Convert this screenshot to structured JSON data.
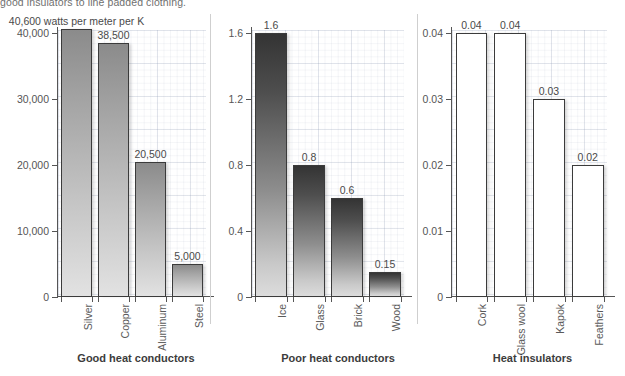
{
  "body_text": "good insulators to line padded clothing.",
  "chart_data": [
    {
      "type": "bar",
      "title": "Good heat conductors",
      "unit_annotation": "40,600 watts per meter per K",
      "categories": [
        "Silver",
        "Copper",
        "Aluminum",
        "Steel"
      ],
      "values": [
        40600,
        38500,
        20500,
        5000
      ],
      "value_labels": [
        "40,600 watts per meter per K",
        "38,500",
        "20,500",
        "5,000"
      ],
      "ticks": [
        0,
        10000,
        20000,
        30000,
        40000
      ],
      "tick_labels": [
        "0",
        "10,000",
        "20,000",
        "30,000",
        "40,000"
      ],
      "ylim": [
        0,
        40600
      ],
      "xlabel": "",
      "ylabel": "",
      "grid": true,
      "bar_style": "style-light"
    },
    {
      "type": "bar",
      "title": "Poor heat conductors",
      "categories": [
        "Ice",
        "Glass",
        "Brick",
        "Wood"
      ],
      "values": [
        1.6,
        0.8,
        0.6,
        0.15
      ],
      "value_labels": [
        "1.6",
        "0.8",
        "0.6",
        "0.15"
      ],
      "ticks": [
        0,
        0.4,
        0.8,
        1.2,
        1.6
      ],
      "tick_labels": [
        "0",
        "0.4",
        "0.8",
        "1.2",
        "1.6"
      ],
      "ylim": [
        0,
        1.6
      ],
      "xlabel": "",
      "ylabel": "",
      "grid": true,
      "bar_style": "style-dark"
    },
    {
      "type": "bar",
      "title": "Heat insulators",
      "categories": [
        "Cork",
        "Glass wool",
        "Kapok",
        "Feathers"
      ],
      "values": [
        0.04,
        0.04,
        0.03,
        0.02
      ],
      "value_labels": [
        "0.04",
        "0.04",
        "0.03",
        "0.02"
      ],
      "ticks": [
        0,
        0.01,
        0.02,
        0.03,
        0.04
      ],
      "tick_labels": [
        "0",
        "0.01",
        "0.02",
        "0.03",
        "0.04"
      ],
      "ylim": [
        0,
        0.04
      ],
      "xlabel": "",
      "ylabel": "",
      "grid": true,
      "bar_style": "style-white"
    }
  ],
  "colors": {
    "axis": "#555555",
    "text": "#4a4a4a",
    "caption": "#3c3c3c",
    "grid": "#96a0b9",
    "bar_outline": "#3b3b3b"
  }
}
